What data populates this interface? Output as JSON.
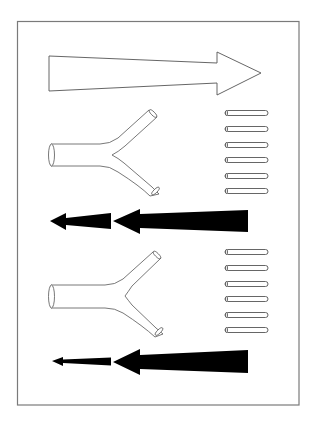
{
  "diagram": {
    "colors": {
      "background": "#ffffff",
      "frame_stroke": "#7a7a7a",
      "outline_stroke": "#555555",
      "solid_fill": "#000000"
    },
    "frame": {
      "x": 17,
      "y": 21,
      "width": 282,
      "height": 384
    },
    "elements": [
      {
        "id": "open-arrow-right",
        "type": "hollow-arrow",
        "direction": "right",
        "points": [
          [
            49,
            56
          ],
          [
            217,
            63
          ],
          [
            217,
            52
          ],
          [
            261,
            73
          ],
          [
            217,
            95
          ],
          [
            217,
            83
          ],
          [
            49,
            91
          ]
        ]
      },
      {
        "id": "y-tube-1",
        "type": "branching-tube",
        "inlet_center": [
          51,
          155
        ],
        "upper_outlet_center": [
          153,
          113
        ],
        "lower_outlet_center": [
          156,
          190
        ]
      },
      {
        "id": "rods-1",
        "type": "rod-column",
        "count": 6,
        "x": 225,
        "width": 43,
        "height": 5,
        "y_centers": [
          113,
          129,
          145,
          160,
          176,
          191
        ]
      },
      {
        "id": "solid-arrows-1",
        "type": "solid-arrow-pair",
        "direction": "left",
        "small_arrow": [
          [
            50,
            221
          ],
          [
            66,
            213
          ],
          [
            66,
            218
          ],
          [
            111,
            213
          ],
          [
            111,
            229
          ],
          [
            66,
            225
          ],
          [
            66,
            230
          ]
        ],
        "large_arrow": [
          [
            113,
            221
          ],
          [
            140,
            209
          ],
          [
            140,
            214
          ],
          [
            248,
            210
          ],
          [
            248,
            232
          ],
          [
            140,
            228
          ],
          [
            140,
            234
          ]
        ]
      },
      {
        "id": "y-tube-2",
        "type": "branching-tube",
        "inlet_center": [
          51,
          297
        ],
        "upper_outlet_center": [
          157,
          255
        ],
        "lower_outlet_center": [
          159,
          331
        ]
      },
      {
        "id": "rods-2",
        "type": "rod-column",
        "count": 6,
        "x": 225,
        "width": 43,
        "height": 5,
        "y_centers": [
          252,
          268,
          284,
          299,
          315,
          330
        ]
      },
      {
        "id": "solid-arrows-2",
        "type": "solid-arrow-pair",
        "direction": "left",
        "small_arrow": [
          [
            52,
            361
          ],
          [
            63,
            357
          ],
          [
            63,
            359.5
          ],
          [
            111,
            357.5
          ],
          [
            111,
            365.5
          ],
          [
            63,
            363
          ],
          [
            63,
            366
          ]
        ],
        "large_arrow": [
          [
            113,
            362
          ],
          [
            140,
            349
          ],
          [
            140,
            355
          ],
          [
            248,
            350
          ],
          [
            248,
            373
          ],
          [
            140,
            369
          ],
          [
            140,
            375
          ]
        ]
      }
    ]
  }
}
